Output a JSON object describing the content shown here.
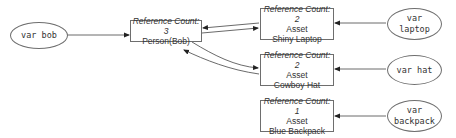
{
  "diagram": {
    "title": "",
    "nodes": {
      "person": {
        "ref_count": "Reference Count: 3",
        "type": "Person(Bob)"
      },
      "laptop": {
        "ref_count": "Reference Count: 2",
        "type": "Asset",
        "name": "Shiny Laptop"
      },
      "hat": {
        "ref_count": "Reference Count: 2",
        "type": "Asset",
        "name": "Cowboy Hat"
      },
      "backpack": {
        "ref_count": "Reference Count: 1",
        "type": "Asset",
        "name": "Blue Backpack"
      }
    },
    "variables": {
      "bob": {
        "line1": "var bob"
      },
      "laptop": {
        "line1": "var",
        "line2": "laptop"
      },
      "hat": {
        "line1": "var hat"
      },
      "backpack": {
        "line1": "var",
        "line2": "backpack"
      }
    },
    "edges": [
      {
        "from": "var bob",
        "to": "Person(Bob)"
      },
      {
        "from": "var laptop",
        "to": "Shiny Laptop"
      },
      {
        "from": "var hat",
        "to": "Cowboy Hat"
      },
      {
        "from": "var backpack",
        "to": "Blue Backpack"
      },
      {
        "from": "Person(Bob)",
        "to": "Shiny Laptop"
      },
      {
        "from": "Shiny Laptop",
        "to": "Person(Bob)"
      },
      {
        "from": "Person(Bob)",
        "to": "Cowboy Hat"
      },
      {
        "from": "Cowboy Hat",
        "to": "Person(Bob)"
      }
    ],
    "colors": {
      "stroke": "#333333",
      "text": "#333333",
      "background": "#ffffff"
    }
  }
}
